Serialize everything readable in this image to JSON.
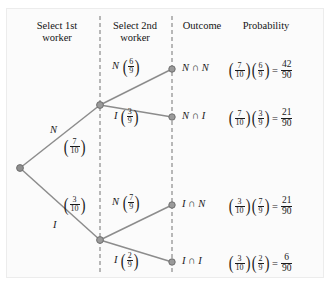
{
  "headers": {
    "stage1": "Select 1st\nworker",
    "stage2": "Select 2nd\nworker",
    "outcome": "Outcome",
    "probability": "Probability"
  },
  "colors": {
    "branch": "#8c8c8c",
    "node": "#8e8e8e",
    "divider": "#8a8a8a",
    "text": "#1a1a1a",
    "background": "#fbfbfb"
  },
  "stage1_branches": [
    {
      "id": "N",
      "label": "N",
      "prob_num": "7",
      "prob_den": "10"
    },
    {
      "id": "I",
      "label": "I",
      "prob_num": "3",
      "prob_den": "10"
    }
  ],
  "stage2_branches": [
    {
      "id": "NN",
      "label": "N",
      "prob_num": "6",
      "prob_den": "9"
    },
    {
      "id": "NI",
      "label": "I",
      "prob_num": "3",
      "prob_den": "9"
    },
    {
      "id": "IN",
      "label": "N",
      "prob_num": "7",
      "prob_den": "9"
    },
    {
      "id": "II",
      "label": "I",
      "prob_num": "2",
      "prob_den": "9"
    }
  ],
  "rows": [
    {
      "outcome": "N ∩ N",
      "f1_num": "7",
      "f1_den": "10",
      "f2_num": "6",
      "f2_den": "9",
      "equals": "=",
      "result_num": "42",
      "result_den": "90"
    },
    {
      "outcome": "N ∩ I",
      "f1_num": "7",
      "f1_den": "10",
      "f2_num": "3",
      "f2_den": "9",
      "equals": "=",
      "result_num": "21",
      "result_den": "90"
    },
    {
      "outcome": "I ∩ N",
      "f1_num": "3",
      "f1_den": "10",
      "f2_num": "7",
      "f2_den": "9",
      "equals": "=",
      "result_num": "21",
      "result_den": "90"
    },
    {
      "outcome": "I ∩ I",
      "f1_num": "3",
      "f1_den": "10",
      "f2_num": "2",
      "f2_den": "9",
      "equals": "=",
      "result_num": "6",
      "result_den": "90"
    }
  ]
}
